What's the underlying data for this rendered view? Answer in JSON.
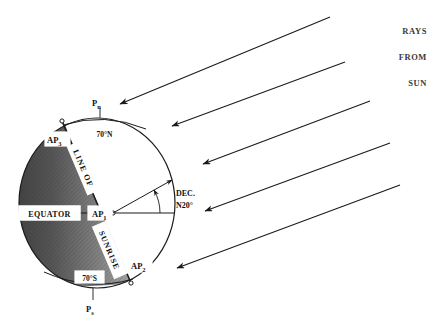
{
  "diagram": {
    "background_color": "#ffffff",
    "line_color": "#1a1a1a",
    "night_shade_dark": "#4a4a4a",
    "night_shade_light": "#9a9a9a",
    "day_color": "#ffffff"
  },
  "rays": {
    "caption_lines": [
      "RAYS",
      "FROM",
      "SUN"
    ],
    "count": 5,
    "direction": "down-left",
    "angle_degrees": 20
  },
  "globe": {
    "poles": {
      "north": "P",
      "north_sub": "n",
      "south": "P",
      "south_sub": "s"
    },
    "latitudes": {
      "north": "70°N",
      "south": "70°S",
      "equator": "EQUATOR"
    },
    "terminator": {
      "line_1": "LINE OF",
      "line_2": "SUNRISE"
    },
    "assumed_positions": [
      {
        "id": "AP1",
        "base": "AP",
        "sub": "1"
      },
      {
        "id": "AP2",
        "base": "AP",
        "sub": "2"
      },
      {
        "id": "AP3",
        "base": "AP",
        "sub": "3"
      }
    ],
    "declination": {
      "line_1": "DEC.",
      "line_2": "N20°",
      "value_degrees": 20,
      "hemisphere": "N"
    }
  }
}
